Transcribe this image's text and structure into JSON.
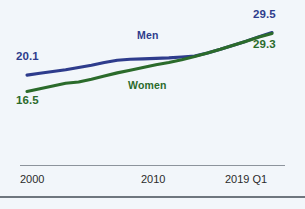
{
  "chart_data": {
    "type": "line",
    "title": "",
    "subtitle": "",
    "xlabel": "",
    "ylabel": "",
    "x": [
      2000,
      2001,
      2002,
      2003,
      2004,
      2005,
      2006,
      2007,
      2008,
      2009,
      2010,
      2011,
      2012,
      2013,
      2014,
      2015,
      2016,
      2017,
      2018,
      2019
    ],
    "xtick_labels": [
      "2000",
      "2010",
      "2019 Q1"
    ],
    "xtick_positions": [
      2000,
      2010,
      2019
    ],
    "xlim": [
      2000,
      2019
    ],
    "ylim": [
      15.5,
      30.5
    ],
    "grid": false,
    "legend": "inline-labels",
    "series": [
      {
        "name": "Men",
        "color": "#2e3c8c",
        "start_label": "20.1",
        "end_label": "29.5",
        "start_value": 20.1,
        "end_value": 29.5,
        "values": [
          20.1,
          20.5,
          20.9,
          21.3,
          21.8,
          22.3,
          22.9,
          23.4,
          23.6,
          23.7,
          23.8,
          23.9,
          24.1,
          24.3,
          25.0,
          25.8,
          26.7,
          27.6,
          28.6,
          29.5
        ]
      },
      {
        "name": "Women",
        "color": "#2b6b2b",
        "start_label": "16.5",
        "end_label": "29.3",
        "start_value": 16.5,
        "end_value": 29.3,
        "values": [
          16.5,
          17.1,
          17.7,
          18.3,
          18.6,
          19.2,
          19.9,
          20.6,
          21.2,
          21.8,
          22.4,
          22.9,
          23.5,
          24.2,
          25.0,
          25.8,
          26.7,
          27.6,
          28.5,
          29.3
        ]
      }
    ]
  },
  "labels": {
    "men_series": "Men",
    "women_series": "Women",
    "men_start": "20.1",
    "men_end": "29.5",
    "women_start": "16.5",
    "women_end": "29.3"
  },
  "axis": {
    "ticks": [
      "2000",
      "2010",
      "2019 Q1"
    ]
  },
  "colors": {
    "men": "#2e3c8c",
    "women": "#2b6b2b",
    "background": "#f2f6fa",
    "rule": "#8d949c",
    "rule_bottom": "#6f767e",
    "tick_text": "#2b2b2b"
  }
}
